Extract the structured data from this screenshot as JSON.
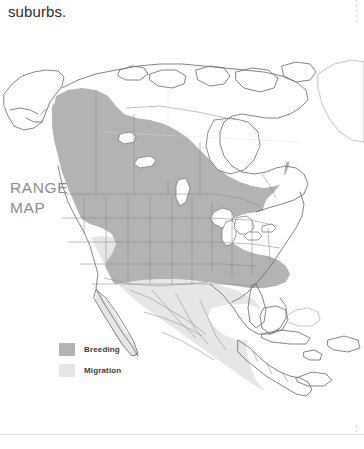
{
  "page": {
    "body_text": "suburbs."
  },
  "figure": {
    "caption_line_1": "RANGE",
    "caption_line_2": "MAP",
    "caption_text": "RANGE MAP"
  },
  "legend": {
    "items": [
      {
        "label": "Breeding",
        "swatch_name": "breeding-swatch",
        "color": "#b3b3b3"
      },
      {
        "label": "Migration",
        "swatch_name": "migration-swatch",
        "color": "#e6e6e6"
      }
    ]
  },
  "map": {
    "title": "RANGE MAP",
    "region": "North America",
    "colors": {
      "breeding_fill": "#b3b3b3",
      "migration_fill": "#e6e6e6",
      "land_outline": "#6e6e6e",
      "internal_border": "#8a8a8a",
      "water_fill": "#ffffff",
      "background": "#ffffff"
    },
    "features": [
      "Alaska",
      "Canada",
      "Greenland",
      "Contiguous United States",
      "Great Lakes",
      "Mexico",
      "Central America",
      "Cuba",
      "Bahamas",
      "Hispaniola",
      "Baja California",
      "Gulf of Mexico",
      "Hudson Bay"
    ]
  }
}
